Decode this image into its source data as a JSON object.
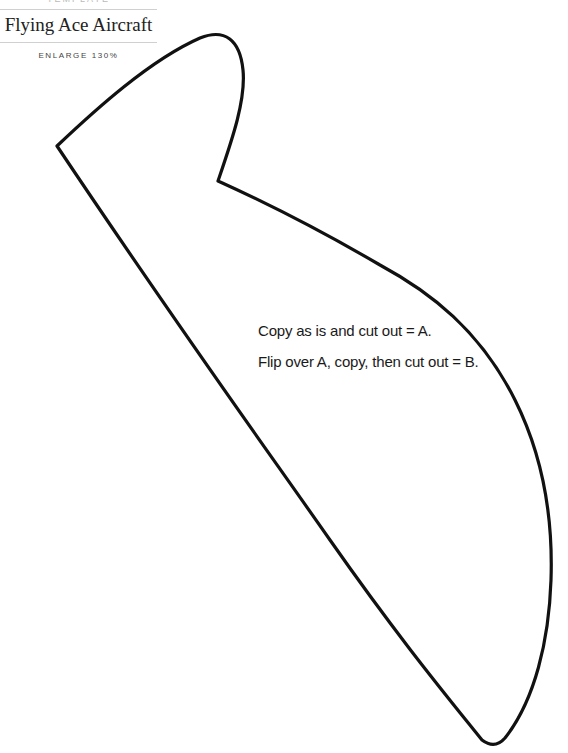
{
  "header": {
    "kicker": "TEMPLATE",
    "title": "Flying Ace Aircraft",
    "subtitle": "ENLARGE 130%"
  },
  "template": {
    "shape_name": "wing-piece",
    "stroke_color": "#111111",
    "instructions": [
      "Copy as is and cut out = A.",
      "Flip over A, copy, then cut out = B."
    ]
  }
}
